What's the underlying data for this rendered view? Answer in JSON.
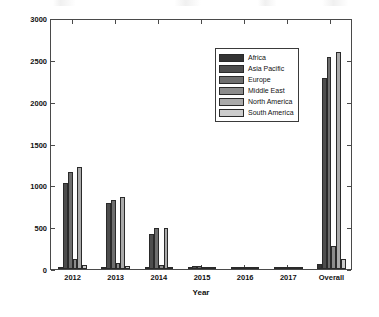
{
  "chart_data": {
    "type": "bar",
    "title": "",
    "xlabel": "Year",
    "ylabel": "Patent-Cited Scholarly Output",
    "categories": [
      "2012",
      "2013",
      "2014",
      "2015",
      "2016",
      "2017",
      "Overall"
    ],
    "ylim": [
      0,
      3000
    ],
    "yticks": [
      0,
      500,
      1000,
      1500,
      2000,
      2500,
      3000
    ],
    "ytick_labels": [
      "0",
      "500",
      "1000",
      "1500",
      "2000",
      "2500",
      "3000"
    ],
    "grid": false,
    "legend_position": "upper center-right",
    "series": [
      {
        "name": "Africa",
        "color": "#333333",
        "values": [
          20,
          18,
          12,
          5,
          0,
          0,
          55
        ]
      },
      {
        "name": "Asia Pacific",
        "color": "#4d4d4d",
        "values": [
          1030,
          790,
          420,
          35,
          4,
          2,
          2280
        ]
      },
      {
        "name": "Europe",
        "color": "#6e6e6e",
        "values": [
          1160,
          820,
          490,
          40,
          5,
          3,
          2530
        ]
      },
      {
        "name": "Middle East",
        "color": "#8c8c8c",
        "values": [
          120,
          75,
          45,
          8,
          0,
          0,
          270
        ]
      },
      {
        "name": "North America",
        "color": "#aaaaaa",
        "values": [
          1225,
          855,
          490,
          30,
          4,
          2,
          2595
        ]
      },
      {
        "name": "South America",
        "color": "#cccccc",
        "values": [
          50,
          35,
          20,
          5,
          0,
          0,
          120
        ]
      }
    ]
  },
  "axes": {
    "y_axis_name": "y-axis",
    "x_axis_name": "x-axis"
  }
}
